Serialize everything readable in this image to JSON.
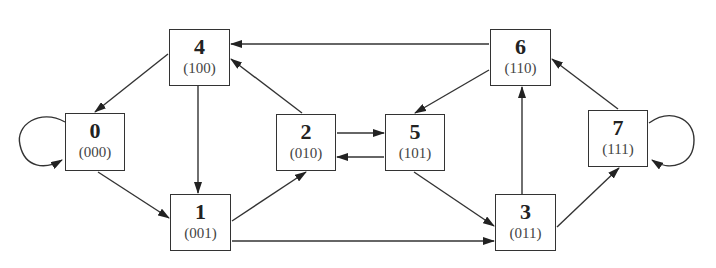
{
  "diagram": {
    "type": "state-transition-graph",
    "colors": {
      "stroke": "#333333",
      "background": "#ffffff",
      "text": "#222222",
      "subtext": "#444444"
    },
    "nodes": [
      {
        "id": "0",
        "label": "0",
        "bits": "(000)",
        "x": 65,
        "y": 113,
        "w": 60,
        "h": 58
      },
      {
        "id": "1",
        "label": "1",
        "bits": "(001)",
        "x": 170,
        "y": 194,
        "w": 61,
        "h": 57
      },
      {
        "id": "2",
        "label": "2",
        "bits": "(010)",
        "x": 276,
        "y": 114,
        "w": 60,
        "h": 57
      },
      {
        "id": "3",
        "label": "3",
        "bits": "(011)",
        "x": 495,
        "y": 194,
        "w": 61,
        "h": 57
      },
      {
        "id": "4",
        "label": "4",
        "bits": "(100)",
        "x": 169,
        "y": 29,
        "w": 61,
        "h": 57
      },
      {
        "id": "5",
        "label": "5",
        "bits": "(101)",
        "x": 385,
        "y": 114,
        "w": 60,
        "h": 57
      },
      {
        "id": "6",
        "label": "6",
        "bits": "(110)",
        "x": 490,
        "y": 29,
        "w": 61,
        "h": 57
      },
      {
        "id": "7",
        "label": "7",
        "bits": "(111)",
        "x": 588,
        "y": 110,
        "w": 60,
        "h": 57
      }
    ],
    "edges": [
      {
        "from": "0",
        "to": "0",
        "kind": "self-loop"
      },
      {
        "from": "0",
        "to": "1"
      },
      {
        "from": "4",
        "to": "0"
      },
      {
        "from": "4",
        "to": "1"
      },
      {
        "from": "1",
        "to": "2"
      },
      {
        "from": "1",
        "to": "3"
      },
      {
        "from": "2",
        "to": "4"
      },
      {
        "from": "2",
        "to": "5"
      },
      {
        "from": "5",
        "to": "2"
      },
      {
        "from": "5",
        "to": "3"
      },
      {
        "from": "6",
        "to": "4"
      },
      {
        "from": "6",
        "to": "5"
      },
      {
        "from": "3",
        "to": "6"
      },
      {
        "from": "3",
        "to": "7"
      },
      {
        "from": "7",
        "to": "6"
      },
      {
        "from": "7",
        "to": "7",
        "kind": "self-loop"
      }
    ]
  }
}
